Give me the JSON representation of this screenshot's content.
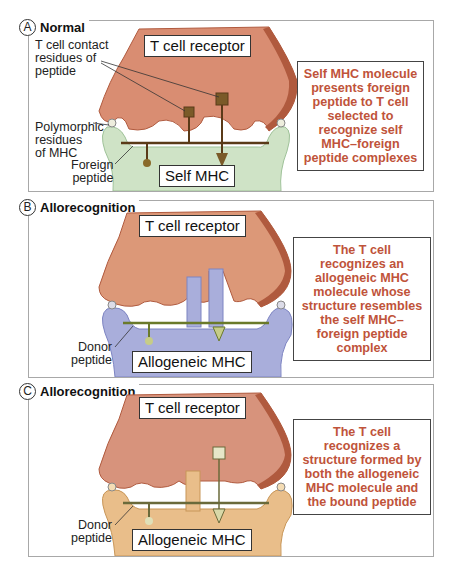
{
  "panels": [
    {
      "letter": "A",
      "title": "Normal",
      "receptor_label": "T cell receptor",
      "mhc_label": "Self MHC",
      "callouts": {
        "contact": "T cell contact\nresidues of\npeptide",
        "polymorphic": "Polymorphic\nresidues\nof MHC",
        "peptide": "Foreign\npeptide"
      },
      "description": "Self MHC molecule\npresents foreign\npeptide to T cell\nselected to\nrecognize self\nMHC–foreign\npeptide complexes",
      "colors": {
        "tcr": "#d98d72",
        "tcr_edge": "#b05a3e",
        "mhc": "#cfe3c6",
        "mhc_edge": "#9fc299",
        "peptide": "#6b4a22"
      }
    },
    {
      "letter": "B",
      "title": "Allorecognition",
      "receptor_label": "T cell receptor",
      "mhc_label": "Allogeneic MHC",
      "callouts": {
        "peptide": "Donor\npeptide"
      },
      "description": "The  T cell\nrecognizes an\nallogeneic MHC\nmolecule whose\nstructure resembles\nthe self MHC–\nforeign peptide\ncomplex",
      "colors": {
        "tcr": "#dc9878",
        "tcr_edge": "#b05a3e",
        "mhc": "#a9aedb",
        "mhc_edge": "#7d84c2",
        "peptide": "#8a9a3a"
      }
    },
    {
      "letter": "C",
      "title": "Allorecognition",
      "receptor_label": "T cell receptor",
      "mhc_label": "Allogeneic MHC",
      "callouts": {
        "peptide": "Donor\npeptide"
      },
      "description": "The T cell\nrecognizes a\nstructure formed by\nboth the allogeneic\nMHC molecule and\nthe bound peptide",
      "colors": {
        "tcr": "#d7937c",
        "tcr_edge": "#b05a3e",
        "mhc": "#e9be8a",
        "mhc_edge": "#c89658",
        "peptide": "#8a8a55"
      }
    }
  ]
}
